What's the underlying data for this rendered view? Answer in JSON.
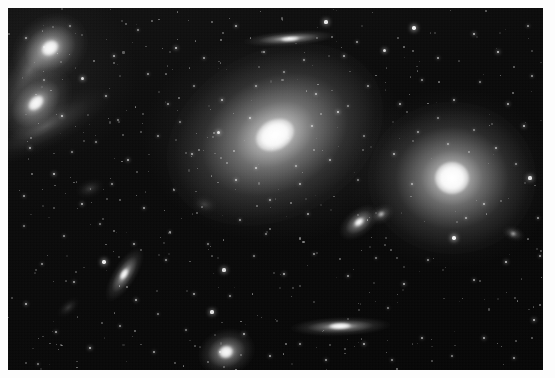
{
  "image": {
    "kind": "astronomical-photograph",
    "subject": "galaxy cluster field",
    "width": 555,
    "height": 378,
    "border": {
      "color": "#fdfdfd",
      "inset_px": 8
    },
    "plate": {
      "x": 8,
      "y": 8,
      "width": 535,
      "height": 362,
      "background_color": "#070707",
      "sky_color": "#101010",
      "star_color": "#ffffff",
      "galaxy_color": "#ffffff"
    }
  },
  "galaxies": [
    {
      "name": "central-bright-elliptical",
      "cx": 267,
      "cy": 127,
      "rx": 60,
      "ry": 44,
      "angle": -28,
      "core_rx": 20,
      "core_ry": 15,
      "brightness": 1.0
    },
    {
      "name": "right-bright-elliptical",
      "cx": 444,
      "cy": 170,
      "rx": 44,
      "ry": 40,
      "angle": 0,
      "core_rx": 17,
      "core_ry": 16,
      "brightness": 1.0
    },
    {
      "name": "upper-left-pair-north",
      "cx": 42,
      "cy": 40,
      "rx": 21,
      "ry": 17,
      "angle": -35,
      "core_rx": 9,
      "core_ry": 7,
      "brightness": 0.95
    },
    {
      "name": "upper-left-pair-south",
      "cx": 28,
      "cy": 95,
      "rx": 22,
      "ry": 15,
      "angle": -45,
      "core_rx": 9,
      "core_ry": 6,
      "brightness": 0.9
    },
    {
      "name": "upper-left-tidal-arc-north",
      "cx": 22,
      "cy": 62,
      "rx": 34,
      "ry": 12,
      "angle": -55,
      "core_rx": 0,
      "core_ry": 0,
      "brightness": 0.32
    },
    {
      "name": "upper-left-tidal-arc-south",
      "cx": 38,
      "cy": 118,
      "rx": 38,
      "ry": 11,
      "angle": -28,
      "core_rx": 0,
      "core_ry": 0,
      "brightness": 0.3
    },
    {
      "name": "top-edge-on-spiral",
      "cx": 282,
      "cy": 31,
      "rx": 24,
      "ry": 4,
      "angle": -4,
      "core_rx": 9,
      "core_ry": 2,
      "brightness": 0.92
    },
    {
      "name": "mid-right-inclined-lenticular",
      "cx": 351,
      "cy": 214,
      "rx": 12,
      "ry": 7,
      "angle": -38,
      "core_rx": 5,
      "core_ry": 3,
      "brightness": 0.88
    },
    {
      "name": "left-inclined-lenticular",
      "cx": 116,
      "cy": 266,
      "rx": 16,
      "ry": 6,
      "angle": -58,
      "core_rx": 6,
      "core_ry": 3,
      "brightness": 0.9
    },
    {
      "name": "lower-right-edge-on-spiral",
      "cx": 332,
      "cy": 318,
      "rx": 26,
      "ry": 5,
      "angle": -2,
      "core_rx": 11,
      "core_ry": 3,
      "brightness": 0.93
    },
    {
      "name": "bottom-face-on-spiral",
      "cx": 218,
      "cy": 344,
      "rx": 15,
      "ry": 12,
      "angle": -18,
      "core_rx": 7,
      "core_ry": 6,
      "brightness": 0.9
    },
    {
      "name": "upper-right-faint-companion",
      "cx": 373,
      "cy": 206,
      "rx": 7,
      "ry": 5,
      "angle": -30,
      "core_rx": 3,
      "core_ry": 2,
      "brightness": 0.5
    },
    {
      "name": "right-small-companion",
      "cx": 505,
      "cy": 226,
      "rx": 6,
      "ry": 4,
      "angle": 20,
      "core_rx": 2,
      "core_ry": 2,
      "brightness": 0.45
    },
    {
      "name": "far-left-faint-smudge",
      "cx": 82,
      "cy": 180,
      "rx": 8,
      "ry": 5,
      "angle": -20,
      "core_rx": 0,
      "core_ry": 0,
      "brightness": 0.22
    },
    {
      "name": "mid-field-faint-smudge",
      "cx": 196,
      "cy": 196,
      "rx": 7,
      "ry": 5,
      "angle": 15,
      "core_rx": 0,
      "core_ry": 0,
      "brightness": 0.2
    },
    {
      "name": "lower-left-faint-smudge",
      "cx": 60,
      "cy": 300,
      "rx": 7,
      "ry": 4,
      "angle": -40,
      "core_rx": 0,
      "core_ry": 0,
      "brightness": 0.2
    }
  ],
  "stars": [
    {
      "x": 318,
      "y": 14,
      "r": 1.6,
      "b": 0.9
    },
    {
      "x": 228,
      "y": 18,
      "r": 1.2,
      "b": 0.7
    },
    {
      "x": 406,
      "y": 20,
      "r": 1.8,
      "b": 0.95
    },
    {
      "x": 466,
      "y": 26,
      "r": 1.3,
      "b": 0.75
    },
    {
      "x": 349,
      "y": 34,
      "r": 1.1,
      "b": 0.6
    },
    {
      "x": 130,
      "y": 22,
      "r": 1.0,
      "b": 0.55
    },
    {
      "x": 168,
      "y": 40,
      "r": 1.4,
      "b": 0.8
    },
    {
      "x": 196,
      "y": 50,
      "r": 1.2,
      "b": 0.65
    },
    {
      "x": 256,
      "y": 44,
      "r": 1.1,
      "b": 0.6
    },
    {
      "x": 296,
      "y": 52,
      "r": 1.0,
      "b": 0.55
    },
    {
      "x": 336,
      "y": 48,
      "r": 1.3,
      "b": 0.7
    },
    {
      "x": 376,
      "y": 42,
      "r": 1.5,
      "b": 0.85
    },
    {
      "x": 430,
      "y": 50,
      "r": 1.2,
      "b": 0.65
    },
    {
      "x": 490,
      "y": 44,
      "r": 1.4,
      "b": 0.8
    },
    {
      "x": 520,
      "y": 18,
      "r": 1.1,
      "b": 0.6
    },
    {
      "x": 106,
      "y": 48,
      "r": 1.3,
      "b": 0.7
    },
    {
      "x": 62,
      "y": 18,
      "r": 1.0,
      "b": 0.5
    },
    {
      "x": 18,
      "y": 30,
      "r": 1.1,
      "b": 0.6
    },
    {
      "x": 74,
      "y": 70,
      "r": 1.5,
      "b": 0.85
    },
    {
      "x": 98,
      "y": 88,
      "r": 1.2,
      "b": 0.65
    },
    {
      "x": 54,
      "y": 108,
      "r": 1.4,
      "b": 0.78
    },
    {
      "x": 22,
      "y": 140,
      "r": 1.3,
      "b": 0.7
    },
    {
      "x": 140,
      "y": 66,
      "r": 1.1,
      "b": 0.6
    },
    {
      "x": 160,
      "y": 96,
      "r": 1.2,
      "b": 0.62
    },
    {
      "x": 186,
      "y": 78,
      "r": 1.0,
      "b": 0.52
    },
    {
      "x": 214,
      "y": 92,
      "r": 1.3,
      "b": 0.72
    },
    {
      "x": 248,
      "y": 78,
      "r": 1.1,
      "b": 0.58
    },
    {
      "x": 308,
      "y": 86,
      "r": 1.2,
      "b": 0.66
    },
    {
      "x": 330,
      "y": 104,
      "r": 1.4,
      "b": 0.8
    },
    {
      "x": 360,
      "y": 78,
      "r": 1.2,
      "b": 0.64
    },
    {
      "x": 392,
      "y": 96,
      "r": 1.3,
      "b": 0.7
    },
    {
      "x": 414,
      "y": 72,
      "r": 1.1,
      "b": 0.58
    },
    {
      "x": 446,
      "y": 92,
      "r": 1.2,
      "b": 0.66
    },
    {
      "x": 472,
      "y": 74,
      "r": 1.0,
      "b": 0.52
    },
    {
      "x": 500,
      "y": 96,
      "r": 1.3,
      "b": 0.72
    },
    {
      "x": 524,
      "y": 68,
      "r": 1.1,
      "b": 0.6
    },
    {
      "x": 516,
      "y": 118,
      "r": 1.4,
      "b": 0.8
    },
    {
      "x": 488,
      "y": 140,
      "r": 1.2,
      "b": 0.66
    },
    {
      "x": 410,
      "y": 124,
      "r": 1.1,
      "b": 0.58
    },
    {
      "x": 386,
      "y": 146,
      "r": 1.3,
      "b": 0.72
    },
    {
      "x": 356,
      "y": 128,
      "r": 1.0,
      "b": 0.5
    },
    {
      "x": 322,
      "y": 152,
      "r": 1.2,
      "b": 0.64
    },
    {
      "x": 210,
      "y": 124,
      "r": 1.5,
      "b": 0.85
    },
    {
      "x": 184,
      "y": 146,
      "r": 1.2,
      "b": 0.66
    },
    {
      "x": 150,
      "y": 128,
      "r": 1.1,
      "b": 0.58
    },
    {
      "x": 120,
      "y": 152,
      "r": 1.3,
      "b": 0.72
    },
    {
      "x": 88,
      "y": 134,
      "r": 1.0,
      "b": 0.52
    },
    {
      "x": 46,
      "y": 166,
      "r": 1.4,
      "b": 0.8
    },
    {
      "x": 16,
      "y": 188,
      "r": 1.2,
      "b": 0.64
    },
    {
      "x": 74,
      "y": 196,
      "r": 1.3,
      "b": 0.74
    },
    {
      "x": 104,
      "y": 176,
      "r": 1.1,
      "b": 0.58
    },
    {
      "x": 136,
      "y": 200,
      "r": 1.2,
      "b": 0.66
    },
    {
      "x": 166,
      "y": 182,
      "r": 1.0,
      "b": 0.52
    },
    {
      "x": 228,
      "y": 172,
      "r": 1.3,
      "b": 0.72
    },
    {
      "x": 262,
      "y": 192,
      "r": 1.1,
      "b": 0.6
    },
    {
      "x": 292,
      "y": 176,
      "r": 1.2,
      "b": 0.64
    },
    {
      "x": 446,
      "y": 230,
      "r": 1.8,
      "b": 0.95
    },
    {
      "x": 476,
      "y": 196,
      "r": 1.2,
      "b": 0.66
    },
    {
      "x": 522,
      "y": 170,
      "r": 1.6,
      "b": 0.88
    },
    {
      "x": 530,
      "y": 210,
      "r": 1.1,
      "b": 0.6
    },
    {
      "x": 498,
      "y": 254,
      "r": 1.4,
      "b": 0.8
    },
    {
      "x": 466,
      "y": 272,
      "r": 1.2,
      "b": 0.66
    },
    {
      "x": 420,
      "y": 252,
      "r": 1.1,
      "b": 0.58
    },
    {
      "x": 396,
      "y": 276,
      "r": 1.3,
      "b": 0.72
    },
    {
      "x": 368,
      "y": 250,
      "r": 1.0,
      "b": 0.5
    },
    {
      "x": 340,
      "y": 268,
      "r": 1.2,
      "b": 0.64
    },
    {
      "x": 306,
      "y": 246,
      "r": 1.1,
      "b": 0.58
    },
    {
      "x": 276,
      "y": 266,
      "r": 1.3,
      "b": 0.72
    },
    {
      "x": 246,
      "y": 248,
      "r": 1.0,
      "b": 0.52
    },
    {
      "x": 216,
      "y": 262,
      "r": 1.6,
      "b": 0.88
    },
    {
      "x": 186,
      "y": 286,
      "r": 1.2,
      "b": 0.66
    },
    {
      "x": 158,
      "y": 252,
      "r": 1.1,
      "b": 0.6
    },
    {
      "x": 128,
      "y": 292,
      "r": 1.3,
      "b": 0.72
    },
    {
      "x": 96,
      "y": 254,
      "r": 1.7,
      "b": 0.92
    },
    {
      "x": 66,
      "y": 274,
      "r": 1.2,
      "b": 0.64
    },
    {
      "x": 34,
      "y": 256,
      "r": 1.1,
      "b": 0.58
    },
    {
      "x": 18,
      "y": 296,
      "r": 1.3,
      "b": 0.74
    },
    {
      "x": 48,
      "y": 324,
      "r": 1.2,
      "b": 0.66
    },
    {
      "x": 82,
      "y": 340,
      "r": 1.4,
      "b": 0.8
    },
    {
      "x": 112,
      "y": 318,
      "r": 1.1,
      "b": 0.58
    },
    {
      "x": 146,
      "y": 344,
      "r": 1.2,
      "b": 0.64
    },
    {
      "x": 178,
      "y": 322,
      "r": 1.0,
      "b": 0.5
    },
    {
      "x": 204,
      "y": 304,
      "r": 1.6,
      "b": 0.88
    },
    {
      "x": 236,
      "y": 326,
      "r": 1.3,
      "b": 0.72
    },
    {
      "x": 262,
      "y": 348,
      "r": 1.2,
      "b": 0.66
    },
    {
      "x": 292,
      "y": 336,
      "r": 1.1,
      "b": 0.58
    },
    {
      "x": 318,
      "y": 352,
      "r": 1.2,
      "b": 0.64
    },
    {
      "x": 356,
      "y": 336,
      "r": 1.3,
      "b": 0.72
    },
    {
      "x": 384,
      "y": 352,
      "r": 1.1,
      "b": 0.58
    },
    {
      "x": 414,
      "y": 330,
      "r": 1.2,
      "b": 0.66
    },
    {
      "x": 444,
      "y": 348,
      "r": 1.0,
      "b": 0.52
    },
    {
      "x": 476,
      "y": 330,
      "r": 1.3,
      "b": 0.72
    },
    {
      "x": 506,
      "y": 350,
      "r": 1.2,
      "b": 0.64
    },
    {
      "x": 526,
      "y": 312,
      "r": 1.4,
      "b": 0.8
    },
    {
      "x": 232,
      "y": 212,
      "r": 1.1,
      "b": 0.6
    },
    {
      "x": 258,
      "y": 226,
      "r": 1.0,
      "b": 0.5
    },
    {
      "x": 300,
      "y": 206,
      "r": 1.2,
      "b": 0.64
    },
    {
      "x": 162,
      "y": 224,
      "r": 1.1,
      "b": 0.58
    },
    {
      "x": 200,
      "y": 236,
      "r": 1.0,
      "b": 0.5
    },
    {
      "x": 126,
      "y": 236,
      "r": 1.2,
      "b": 0.66
    },
    {
      "x": 92,
      "y": 216,
      "r": 1.0,
      "b": 0.5
    },
    {
      "x": 56,
      "y": 228,
      "r": 1.1,
      "b": 0.58
    },
    {
      "x": 430,
      "y": 110,
      "r": 1.0,
      "b": 0.5
    },
    {
      "x": 404,
      "y": 176,
      "r": 1.1,
      "b": 0.58
    },
    {
      "x": 466,
      "y": 122,
      "r": 1.0,
      "b": 0.5
    },
    {
      "x": 350,
      "y": 172,
      "r": 1.0,
      "b": 0.5
    },
    {
      "x": 276,
      "y": 64,
      "r": 1.0,
      "b": 0.5
    },
    {
      "x": 242,
      "y": 110,
      "r": 1.2,
      "b": 0.7
    },
    {
      "x": 304,
      "y": 118,
      "r": 1.1,
      "b": 0.62
    },
    {
      "x": 248,
      "y": 160,
      "r": 1.2,
      "b": 0.68
    },
    {
      "x": 288,
      "y": 158,
      "r": 1.0,
      "b": 0.55
    },
    {
      "x": 440,
      "y": 136,
      "r": 1.0,
      "b": 0.55
    },
    {
      "x": 458,
      "y": 210,
      "r": 1.1,
      "b": 0.6
    },
    {
      "x": 380,
      "y": 300,
      "r": 1.0,
      "b": 0.5
    },
    {
      "x": 150,
      "y": 306,
      "r": 1.0,
      "b": 0.5
    },
    {
      "x": 222,
      "y": 288,
      "r": 1.1,
      "b": 0.58
    },
    {
      "x": 110,
      "y": 112,
      "r": 1.0,
      "b": 0.5
    },
    {
      "x": 36,
      "y": 72,
      "r": 1.0,
      "b": 0.5
    },
    {
      "x": 64,
      "y": 144,
      "r": 1.0,
      "b": 0.52
    },
    {
      "x": 172,
      "y": 114,
      "r": 1.0,
      "b": 0.5
    },
    {
      "x": 508,
      "y": 156,
      "r": 1.0,
      "b": 0.52
    },
    {
      "x": 532,
      "y": 248,
      "r": 1.1,
      "b": 0.6
    },
    {
      "x": 16,
      "y": 218,
      "r": 1.0,
      "b": 0.5
    },
    {
      "x": 30,
      "y": 356,
      "r": 1.0,
      "b": 0.5
    },
    {
      "x": 340,
      "y": 98,
      "r": 1.0,
      "b": 0.5
    },
    {
      "x": 212,
      "y": 344,
      "r": 1.1,
      "b": 0.62
    }
  ]
}
